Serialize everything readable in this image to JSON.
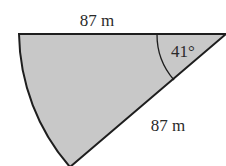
{
  "diagram": {
    "type": "circular-sector",
    "labels": {
      "top_radius": "87 m",
      "slant_radius": "87 m",
      "angle": "41°"
    },
    "colors": {
      "fill": "#c8c8c8",
      "stroke": "#1e1e1e",
      "text": "#2a2a2a"
    }
  }
}
